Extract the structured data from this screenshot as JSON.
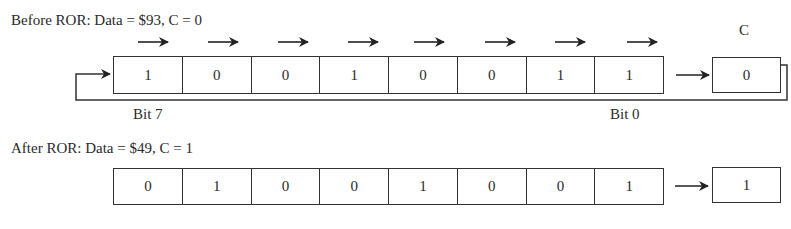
{
  "before": {
    "title": "Before ROR: Data = $93, C = 0",
    "bits": [
      "1",
      "0",
      "0",
      "1",
      "0",
      "0",
      "1",
      "1"
    ],
    "carry_label": "C",
    "carry": "0",
    "bit7_label": "Bit 7",
    "bit0_label": "Bit 0"
  },
  "after": {
    "title": "After ROR: Data = $49, C = 1",
    "bits": [
      "0",
      "1",
      "0",
      "0",
      "1",
      "0",
      "0",
      "1"
    ],
    "carry": "1"
  },
  "icons": {
    "shift_arrow": "right-arrow-icon",
    "carry_arrow": "right-arrow-icon",
    "feedback": "loop-arrow-icon"
  },
  "colors": {
    "line": "#333333",
    "text": "#2a2a2a",
    "background": "#ffffff"
  }
}
